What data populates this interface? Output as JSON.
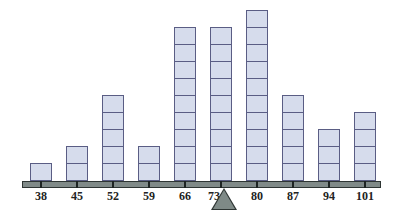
{
  "chart_data": {
    "type": "bar",
    "title": "",
    "xlabel": "",
    "ylabel": "",
    "style": "stacked unit blocks (dot-plot style) on a balance beam with fulcrum at mean",
    "categories": [
      "38",
      "45",
      "52",
      "59",
      "66",
      "73",
      "80",
      "87",
      "94",
      "101"
    ],
    "values": [
      1,
      2,
      5,
      2,
      9,
      9,
      10,
      5,
      3,
      4
    ],
    "fulcrum_at": "73",
    "ylim": [
      0,
      10
    ],
    "grid": false,
    "colors": {
      "block_fill": "#d6dcec",
      "block_border": "#5a5d84",
      "beam": "#808a88",
      "fulcrum": "#7f8a87"
    }
  }
}
